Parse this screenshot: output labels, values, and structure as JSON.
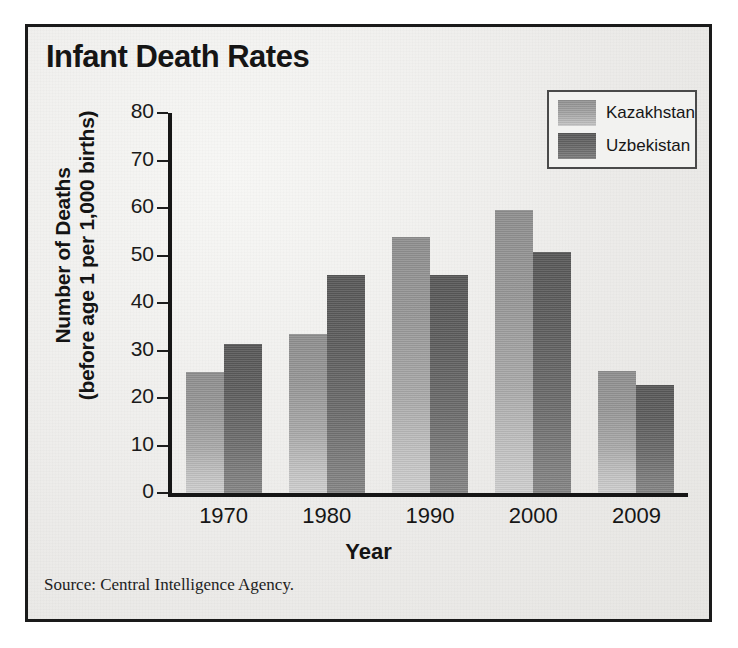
{
  "figure": {
    "title": "Infant Death Rates",
    "source_note": "Source: Central Intelligence Agency."
  },
  "axes": {
    "y_title_line1": "Number of Deaths",
    "y_title_line2": "(before age 1 per 1,000 births)",
    "x_title": "Year",
    "y_ticks": [
      "80",
      "70",
      "60",
      "50",
      "40",
      "30",
      "20",
      "10",
      "0"
    ],
    "x_ticks": [
      "1970",
      "1980",
      "1990",
      "2000",
      "2009"
    ]
  },
  "legend": {
    "items": [
      {
        "label": "Kazakhstan",
        "color": "#a3a3a3"
      },
      {
        "label": "Uzbekistan",
        "color": "#676767"
      }
    ]
  },
  "chart_data": {
    "type": "bar",
    "title": "Infant Death Rates",
    "subtitle": "",
    "xlabel": "Year",
    "ylabel": "Number of Deaths (before age 1 per 1,000 births)",
    "categories": [
      "1970",
      "1980",
      "1990",
      "2000",
      "2009"
    ],
    "series": [
      {
        "name": "Kazakhstan",
        "color": "#a3a3a3",
        "values": [
          25.5,
          33.5,
          53.8,
          59.5,
          25.7
        ]
      },
      {
        "name": "Uzbekistan",
        "color": "#676767",
        "values": [
          31.4,
          46.0,
          46.0,
          50.7,
          22.8
        ]
      }
    ],
    "ylim": [
      0,
      80
    ],
    "ytick_step": 10,
    "grid": false,
    "legend_position": "top-right",
    "annotations": [
      "Source: Central Intelligence Agency."
    ]
  }
}
